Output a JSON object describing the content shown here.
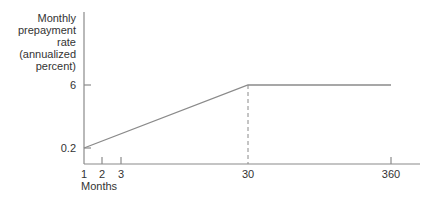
{
  "chart_data": {
    "type": "line",
    "title": "",
    "ylabel_lines": [
      "Monthly",
      "prepayment",
      "rate",
      "(annualized",
      "percent)"
    ],
    "xlabel": "Months",
    "x_ticks": [
      {
        "value": 1,
        "label": "1"
      },
      {
        "value": 2,
        "label": "2"
      },
      {
        "value": 3,
        "label": "3"
      },
      {
        "value": 30,
        "label": "30"
      },
      {
        "value": 360,
        "label": "360"
      }
    ],
    "y_ticks": [
      {
        "value": 0.2,
        "label": "0.2"
      },
      {
        "value": 6,
        "label": "6"
      }
    ],
    "series": [
      {
        "name": "prepayment rate",
        "x": [
          1,
          30,
          360
        ],
        "y": [
          0.2,
          6,
          6
        ]
      }
    ],
    "annotations": [
      {
        "type": "vertical-dashed-line",
        "x": 30,
        "y_from": 0,
        "y_to": 6
      }
    ],
    "grid": false
  }
}
